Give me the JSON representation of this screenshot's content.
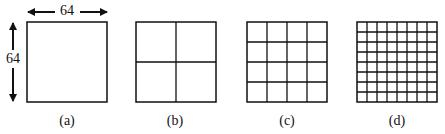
{
  "panels": [
    {
      "label": "(a)",
      "divisions": 1
    },
    {
      "label": "(b)",
      "divisions": 2
    },
    {
      "label": "(c)",
      "divisions": 4
    },
    {
      "label": "(d)",
      "divisions": 8
    }
  ],
  "dimensions": {
    "width_label": "64",
    "height_label": "64"
  }
}
